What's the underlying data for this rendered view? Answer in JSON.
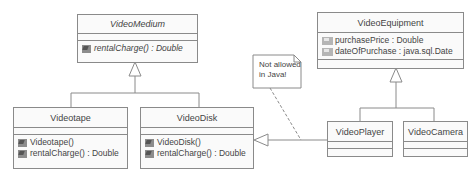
{
  "classes": {
    "video_medium": {
      "name": "VideoMedium",
      "abstract": true,
      "attributes": [],
      "operations": [
        {
          "label": "rentalCharge() : Double",
          "abstract": true
        }
      ]
    },
    "videotape": {
      "name": "Videotape",
      "attributes": [],
      "operations": [
        {
          "label": "Videotape()"
        },
        {
          "label": "rentalCharge() : Double"
        }
      ]
    },
    "video_disk": {
      "name": "VideoDisk",
      "attributes": [],
      "operations": [
        {
          "label": "VideoDisk()"
        },
        {
          "label": "rentalCharge() : Double"
        }
      ]
    },
    "video_equipment": {
      "name": "VideoEquipment",
      "attributes": [
        {
          "label": "purchasePrice : Double"
        },
        {
          "label": "dateOfPurchase : java.sql.Date"
        }
      ],
      "operations": []
    },
    "video_player": {
      "name": "VideoPlayer",
      "attributes": [],
      "operations": []
    },
    "video_camera": {
      "name": "VideoCamera",
      "attributes": [],
      "operations": []
    }
  },
  "note": {
    "line1": "Not allowed",
    "line2": "in Java!"
  },
  "relationships": [
    {
      "type": "generalization",
      "from": "Videotape",
      "to": "VideoMedium"
    },
    {
      "type": "generalization",
      "from": "VideoDisk",
      "to": "VideoMedium"
    },
    {
      "type": "generalization",
      "from": "VideoPlayer",
      "to": "VideoEquipment"
    },
    {
      "type": "generalization",
      "from": "VideoCamera",
      "to": "VideoEquipment"
    },
    {
      "type": "generalization",
      "from": "VideoPlayer",
      "to": "VideoDisk"
    }
  ],
  "colors": {
    "line": "#8a8a8a",
    "box_fill": "#fafafa",
    "text": "#444444"
  }
}
